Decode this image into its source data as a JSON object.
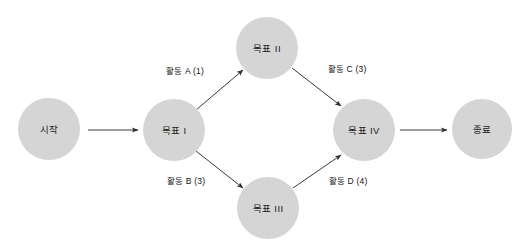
{
  "diagram": {
    "type": "activity-network-diagram",
    "background_color": "#ffffff",
    "node_fill_color": "#d5d5d5",
    "edge_color": "#3a3a3a",
    "text_color": "#1b1b1b",
    "nodes": [
      {
        "id": "start",
        "label": "시작",
        "cx": 49,
        "cy": 129,
        "r": 31
      },
      {
        "id": "goal1",
        "label": "목표 I",
        "cx": 174,
        "cy": 130,
        "r": 31
      },
      {
        "id": "goal2",
        "label": "목표 II",
        "cx": 267,
        "cy": 48,
        "r": 31
      },
      {
        "id": "goal3",
        "label": "목표 III",
        "cx": 268,
        "cy": 208,
        "r": 31
      },
      {
        "id": "goal4",
        "label": "목표 IV",
        "cx": 364,
        "cy": 130,
        "r": 31
      },
      {
        "id": "end",
        "label": "종료",
        "cx": 482,
        "cy": 129,
        "r": 30
      }
    ],
    "edges": [
      {
        "id": "start-to-goal1",
        "from": "start",
        "to": "goal1",
        "label": "",
        "x1": 88,
        "y1": 130,
        "x2": 138,
        "y2": 130,
        "label_x": 0,
        "label_y": 0
      },
      {
        "id": "goal1-to-goal2",
        "from": "goal1",
        "to": "goal2",
        "label": "활동 A (1)",
        "x1": 196,
        "y1": 110,
        "x2": 243,
        "y2": 70,
        "label_x": 185,
        "label_y": 70
      },
      {
        "id": "goal1-to-goal3",
        "from": "goal1",
        "to": "goal3",
        "label": "활동 B (3)",
        "x1": 196,
        "y1": 151,
        "x2": 243,
        "y2": 188,
        "label_x": 186,
        "label_y": 180
      },
      {
        "id": "goal2-to-goal4",
        "from": "goal2",
        "to": "goal4",
        "label": "활동 C (3)",
        "x1": 292,
        "y1": 68,
        "x2": 341,
        "y2": 106,
        "label_x": 347,
        "label_y": 68
      },
      {
        "id": "goal3-to-goal4",
        "from": "goal3",
        "to": "goal4",
        "label": "활동 D (4)",
        "x1": 293,
        "y1": 188,
        "x2": 341,
        "y2": 155,
        "label_x": 348,
        "label_y": 180
      },
      {
        "id": "goal4-to-end",
        "from": "goal4",
        "to": "end",
        "label": "",
        "x1": 400,
        "y1": 130,
        "x2": 447,
        "y2": 130,
        "label_x": 0,
        "label_y": 0
      }
    ]
  }
}
